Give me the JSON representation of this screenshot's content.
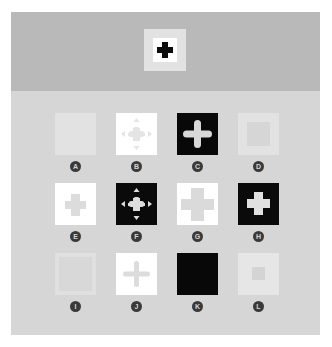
{
  "figure": {
    "header_icon": {
      "name": "plus-icon",
      "description": "black plus on white square with light gray border"
    },
    "tiles": [
      {
        "label": "A",
        "background": "#e2e2e2",
        "glyph": "none",
        "glyph_color": ""
      },
      {
        "label": "B",
        "background": "#ffffff",
        "glyph": "plus-with-arrows",
        "glyph_color": "#e4e4e4"
      },
      {
        "label": "C",
        "background": "#080808",
        "glyph": "rounded-plus",
        "glyph_color": "#d8d8d8"
      },
      {
        "label": "D",
        "background": "#e2e2e2",
        "glyph": "inner-square",
        "glyph_color": "#d6d6d6"
      },
      {
        "label": "E",
        "background": "#ffffff",
        "glyph": "small-plus",
        "glyph_color": "#dcdcdc"
      },
      {
        "label": "F",
        "background": "#0a0a0a",
        "glyph": "plus-with-arrows",
        "glyph_color": "#dcdcdc"
      },
      {
        "label": "G",
        "background": "#ffffff",
        "glyph": "large-plus",
        "glyph_color": "#dadada"
      },
      {
        "label": "H",
        "background": "#0a0a0a",
        "glyph": "plus",
        "glyph_color": "#e0e0e0"
      },
      {
        "label": "I",
        "background": "#e0e0e0",
        "glyph": "inner-square-faint",
        "glyph_color": "#d8d8d8"
      },
      {
        "label": "J",
        "background": "#ffffff",
        "glyph": "thin-plus",
        "glyph_color": "#dcdcdc"
      },
      {
        "label": "K",
        "background": "#080808",
        "glyph": "none",
        "glyph_color": ""
      },
      {
        "label": "L",
        "background": "#e6e6e6",
        "glyph": "small-square",
        "glyph_color": "#d4d4d4"
      }
    ]
  },
  "colors": {
    "panel": "#d6d6d6",
    "top_band": "#b9b9b9",
    "badge": "#3a3a3a"
  }
}
